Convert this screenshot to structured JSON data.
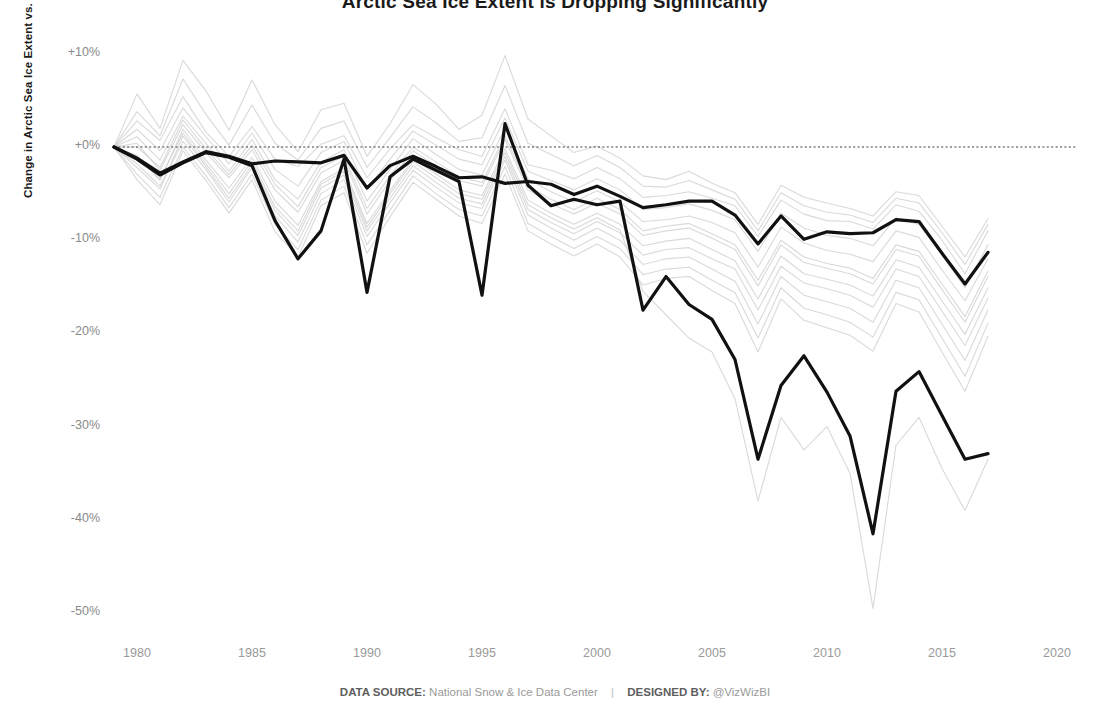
{
  "title": "Arctic Sea Ice Extent is Dropping Significantly",
  "footer": {
    "source_label": "DATA SOURCE:",
    "source_value": "National Snow & Ice Data Center",
    "separator": "|",
    "designer_label": "DESIGNED BY:",
    "designer_value": "@VizWizBI"
  },
  "colors": {
    "highlight": "#111111",
    "context": "#d2d2d2",
    "zero_reference": "#3a3a3a",
    "tick_text": "#9a9a9a",
    "axis_title": "#1a1a1a",
    "background": "#ffffff"
  },
  "chart_data": {
    "type": "line",
    "title": "Arctic Sea Ice Extent is Dropping Significantly",
    "xlabel": "",
    "ylabel": "Change in Arctic Sea Ice Extent vs. 1979",
    "xlim": [
      1978.4,
      2020.6
    ],
    "ylim": [
      -53,
      12
    ],
    "xticks": [
      1980,
      1985,
      1990,
      1995,
      2000,
      2005,
      2010,
      2015,
      2020
    ],
    "xticklabels": [
      "1980",
      "1985",
      "1990",
      "1995",
      "2000",
      "2005",
      "2010",
      "2015",
      "2020"
    ],
    "yticks": [
      10,
      0,
      -10,
      -20,
      -30,
      -40,
      -50
    ],
    "yticklabels": [
      "+10%",
      "+0%",
      "-10%",
      "-20%",
      "-30%",
      "-40%",
      "-50%"
    ],
    "grid": false,
    "legend": "none",
    "reference_lines": [
      {
        "y": 0,
        "style": "dotted",
        "label": "0% (1979 baseline)"
      }
    ],
    "x": [
      1979,
      1980,
      1981,
      1982,
      1983,
      1984,
      1985,
      1986,
      1987,
      1988,
      1989,
      1990,
      1991,
      1992,
      1993,
      1994,
      1995,
      1996,
      1997,
      1998,
      1999,
      2000,
      2001,
      2002,
      2003,
      2004,
      2005,
      2006,
      2007,
      2008,
      2009,
      2010,
      2011,
      2012,
      2013,
      2014,
      2015,
      2016,
      2017
    ],
    "series": [
      {
        "name": "Highlighted series A (upper bold)",
        "emphasis": "highlight",
        "values": [
          0.0,
          -1.2,
          -2.8,
          -1.6,
          -0.5,
          -1.0,
          -1.8,
          -1.5,
          -1.6,
          -1.7,
          -0.9,
          -4.4,
          -2.0,
          -1.0,
          -2.1,
          -3.3,
          -3.2,
          -3.9,
          -3.7,
          -4.0,
          -5.1,
          -4.2,
          -5.3,
          -6.5,
          -6.2,
          -5.8,
          -5.8,
          -7.3,
          -10.4,
          -7.4,
          -9.9,
          -9.1,
          -9.3,
          -9.2,
          -7.8,
          -8.0,
          -11.4,
          -14.7,
          -11.3
        ]
      },
      {
        "name": "Highlighted series B (lower bold)",
        "emphasis": "highlight",
        "values": [
          0.0,
          -1.3,
          -3.0,
          -1.7,
          -0.6,
          -1.1,
          -2.0,
          -7.9,
          -12.0,
          -9.0,
          -1.3,
          -15.6,
          -3.2,
          -1.3,
          -2.5,
          -3.7,
          -15.9,
          2.5,
          -4.1,
          -6.3,
          -5.6,
          -6.2,
          -5.8,
          -17.5,
          -13.9,
          -16.9,
          -18.5,
          -22.8,
          -33.5,
          -25.6,
          -22.4,
          -26.3,
          -31.0,
          -41.5,
          -26.2,
          -24.1,
          -28.8,
          -33.5,
          -32.9
        ]
      },
      {
        "name": "Context region 1",
        "emphasis": "context",
        "values": [
          0.0,
          2.8,
          0.7,
          5.4,
          1.6,
          -1.0,
          2.2,
          -1.3,
          -2.1,
          0.3,
          1.2,
          -3.3,
          -0.2,
          2.4,
          1.0,
          -0.3,
          -1.0,
          4.1,
          -1.9,
          -2.5,
          -3.4,
          -2.2,
          -3.4,
          -5.4,
          -5.2,
          -4.8,
          -5.5,
          -6.3,
          -9.6,
          -5.7,
          -7.2,
          -7.9,
          -8.0,
          -8.8,
          -6.2,
          -6.9,
          -10.0,
          -13.6,
          -9.0
        ]
      },
      {
        "name": "Context region 2",
        "emphasis": "context",
        "values": [
          0.0,
          5.7,
          2.0,
          9.3,
          6.0,
          1.8,
          7.2,
          2.4,
          -0.5,
          4.0,
          4.7,
          -1.0,
          2.5,
          6.7,
          4.6,
          1.9,
          3.4,
          9.8,
          3.0,
          1.2,
          -0.6,
          0.1,
          -1.2,
          -3.1,
          -3.5,
          -2.6,
          -3.9,
          -4.9,
          -8.3,
          -4.1,
          -5.4,
          -6.0,
          -6.6,
          -7.4,
          -4.8,
          -5.2,
          -8.5,
          -11.8,
          -7.7
        ]
      },
      {
        "name": "Context region 3",
        "emphasis": "context",
        "values": [
          0.0,
          1.1,
          -1.4,
          3.3,
          0.4,
          -2.6,
          0.8,
          -3.5,
          -5.6,
          -1.6,
          -0.3,
          -5.8,
          -2.4,
          0.9,
          -0.8,
          -2.4,
          -3.0,
          2.0,
          -3.4,
          -4.8,
          -5.9,
          -4.7,
          -5.9,
          -8.0,
          -7.8,
          -7.4,
          -8.1,
          -9.2,
          -12.9,
          -8.6,
          -10.3,
          -11.1,
          -11.5,
          -12.3,
          -9.0,
          -9.7,
          -13.2,
          -16.5,
          -12.0
        ]
      },
      {
        "name": "Context region 4",
        "emphasis": "context",
        "values": [
          0.0,
          -2.2,
          -4.5,
          1.2,
          -2.1,
          -5.5,
          -1.9,
          -6.8,
          -9.5,
          -4.4,
          -3.0,
          -9.0,
          -5.5,
          -2.0,
          -3.8,
          -5.5,
          -6.1,
          -1.0,
          -6.7,
          -8.1,
          -9.3,
          -8.0,
          -9.2,
          -11.6,
          -11.0,
          -10.8,
          -12.0,
          -13.1,
          -17.5,
          -12.8,
          -14.6,
          -15.2,
          -15.9,
          -17.2,
          -13.1,
          -13.9,
          -17.6,
          -21.3,
          -16.2
        ]
      },
      {
        "name": "Context region 5",
        "emphasis": "context",
        "values": [
          0.0,
          0.4,
          -2.5,
          2.4,
          -0.6,
          -3.3,
          -0.3,
          -4.6,
          -7.0,
          -2.8,
          -1.4,
          -7.2,
          -3.6,
          -0.4,
          -2.0,
          -3.6,
          -4.2,
          0.8,
          -4.6,
          -6.1,
          -7.2,
          -6.0,
          -7.2,
          -9.5,
          -9.0,
          -8.7,
          -9.8,
          -11.0,
          -14.9,
          -10.5,
          -12.4,
          -13.0,
          -13.6,
          -14.7,
          -11.0,
          -11.7,
          -15.3,
          -18.8,
          -13.9
        ]
      },
      {
        "name": "Context region 6",
        "emphasis": "context",
        "values": [
          0.0,
          -0.9,
          -3.6,
          1.9,
          -1.4,
          -4.4,
          -1.1,
          -5.8,
          -8.4,
          -3.7,
          -2.3,
          -8.2,
          -4.7,
          -1.3,
          -2.9,
          -4.6,
          -5.2,
          -0.2,
          -5.7,
          -7.1,
          -8.3,
          -7.1,
          -8.3,
          -10.6,
          -10.1,
          -9.8,
          -11.0,
          -12.2,
          -16.3,
          -11.7,
          -13.6,
          -14.2,
          -14.8,
          -16.0,
          -12.1,
          -12.9,
          -16.5,
          -20.1,
          -15.1
        ]
      },
      {
        "name": "Context region 7",
        "emphasis": "context",
        "values": [
          0.0,
          1.9,
          -0.4,
          4.2,
          1.1,
          -1.8,
          1.5,
          -2.4,
          -4.2,
          -0.6,
          0.6,
          -4.6,
          -1.3,
          1.7,
          0.2,
          -1.3,
          -1.9,
          3.1,
          -2.6,
          -3.6,
          -4.6,
          -3.4,
          -4.6,
          -6.7,
          -6.5,
          -6.1,
          -6.8,
          -7.8,
          -11.2,
          -7.1,
          -8.7,
          -9.5,
          -9.8,
          -10.6,
          -7.6,
          -8.3,
          -11.6,
          -15.1,
          -10.5
        ]
      },
      {
        "name": "Context region 8",
        "emphasis": "context",
        "values": [
          0.0,
          -3.5,
          -6.2,
          -0.4,
          -3.6,
          -7.1,
          -3.5,
          -9.1,
          -11.8,
          -6.3,
          -4.9,
          -11.4,
          -7.5,
          -3.8,
          -5.6,
          -7.4,
          -8.2,
          -2.9,
          -9.0,
          -10.4,
          -11.7,
          -10.4,
          -11.8,
          -14.8,
          -14.1,
          -13.9,
          -15.4,
          -16.8,
          -22.0,
          -16.3,
          -18.6,
          -19.4,
          -20.2,
          -21.9,
          -16.8,
          -17.7,
          -22.0,
          -26.2,
          -20.3
        ]
      },
      {
        "name": "Context region 9",
        "emphasis": "context",
        "values": [
          0.0,
          -1.8,
          -4.2,
          0.6,
          -2.4,
          -5.9,
          -2.2,
          -7.4,
          -10.2,
          -5.0,
          -3.5,
          -9.6,
          -6.0,
          -2.5,
          -4.3,
          -6.0,
          -6.6,
          -1.4,
          -7.3,
          -8.7,
          -10.0,
          -8.7,
          -10.0,
          -12.6,
          -12.0,
          -11.8,
          -13.1,
          -14.4,
          -19.0,
          -13.9,
          -15.9,
          -16.6,
          -17.3,
          -18.8,
          -14.3,
          -15.1,
          -19.0,
          -22.9,
          -17.5
        ]
      },
      {
        "name": "Context region 10",
        "emphasis": "context",
        "values": [
          0.0,
          -2.9,
          -5.4,
          0.0,
          -3.1,
          -6.5,
          -2.9,
          -8.3,
          -11.0,
          -5.7,
          -4.2,
          -10.5,
          -6.8,
          -3.1,
          -5.0,
          -6.7,
          -7.4,
          -2.1,
          -8.2,
          -9.6,
          -10.9,
          -9.6,
          -10.9,
          -13.7,
          -13.1,
          -12.9,
          -14.3,
          -15.6,
          -20.5,
          -15.1,
          -17.3,
          -18.0,
          -18.8,
          -20.4,
          -15.6,
          -16.4,
          -20.5,
          -24.6,
          -18.9
        ]
      },
      {
        "name": "Context region 11 (deep trough)",
        "emphasis": "context",
        "values": [
          0.0,
          -1.0,
          -3.4,
          1.5,
          -1.8,
          -5.0,
          -1.5,
          -6.4,
          -9.0,
          -4.0,
          -2.6,
          -8.6,
          -5.0,
          -1.6,
          -3.3,
          -5.0,
          -5.6,
          -0.6,
          -6.2,
          -7.6,
          -8.8,
          -7.6,
          -8.9,
          -15.5,
          -18.0,
          -20.5,
          -22.0,
          -27.0,
          -38.0,
          -29.0,
          -32.5,
          -30.0,
          -35.0,
          -49.5,
          -32.0,
          -29.0,
          -34.5,
          -39.0,
          -33.5
        ]
      },
      {
        "name": "Context region 12",
        "emphasis": "context",
        "values": [
          0.0,
          0.0,
          -2.2,
          2.9,
          -0.2,
          -3.0,
          0.2,
          -4.0,
          -6.4,
          -2.2,
          -1.0,
          -6.6,
          -3.1,
          0.0,
          -1.6,
          -3.2,
          -3.8,
          1.2,
          -4.2,
          -5.6,
          -6.7,
          -5.5,
          -6.7,
          -9.0,
          -8.5,
          -8.2,
          -9.3,
          -10.5,
          -14.3,
          -10.0,
          -11.8,
          -12.5,
          -13.0,
          -14.1,
          -10.5,
          -11.2,
          -14.7,
          -18.2,
          -13.3
        ]
      },
      {
        "name": "Context region 13",
        "emphasis": "context",
        "values": [
          0.0,
          3.8,
          1.2,
          7.3,
          3.5,
          0.2,
          4.5,
          0.4,
          -1.4,
          2.0,
          2.8,
          -2.2,
          1.0,
          4.3,
          2.6,
          0.6,
          1.0,
          6.6,
          0.4,
          -0.8,
          -2.0,
          -0.9,
          -2.2,
          -4.2,
          -4.3,
          -3.6,
          -4.6,
          -5.6,
          -9.0,
          -4.9,
          -6.3,
          -7.0,
          -7.3,
          -8.1,
          -5.5,
          -6.0,
          -9.2,
          -12.6,
          -8.3
        ]
      }
    ]
  }
}
